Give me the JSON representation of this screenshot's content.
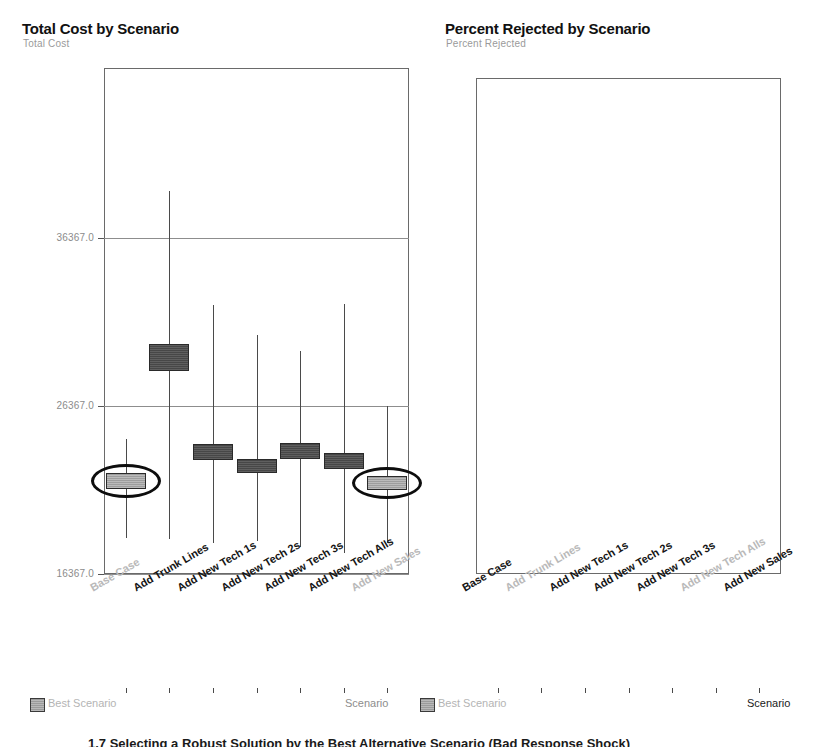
{
  "caption": "1.7 Selecting a Robust Solution by the Best Alternative Scenario (Bad Response Shock)",
  "charts": [
    {
      "id": "total-cost",
      "title": "Total Cost by Scenario",
      "subtitle": "Total Cost",
      "legend_label": "Best Scenario",
      "axis_title": "Scenario",
      "axis_title_active": false,
      "legend_active": false,
      "chart_data": {
        "type": "bar",
        "title": "Total Cost by Scenario",
        "xlabel": "Scenario",
        "ylabel": "Total Cost",
        "ylim": [
          16367.0,
          40896.0
        ],
        "ytick_labels": [
          "36367.0",
          "26367.0",
          "16367.0"
        ],
        "ytick_values": [
          36367.0,
          26367.0,
          16367.0
        ],
        "grid": true,
        "legend_position": "bottom-left",
        "categories": [
          "Base Case",
          "Add Trunk Lines",
          "Add New Tech 1s",
          "Add New Tech 2s",
          "Add New Tech 3s",
          "Add New Tech Alls",
          "Add New Sales"
        ],
        "category_active": [
          false,
          true,
          true,
          true,
          true,
          true,
          false
        ],
        "best_scenario_indices": [
          0,
          6
        ],
        "series": [
          {
            "name": "box-low",
            "values": [
              21450,
              28450,
              23150,
              22400,
              23200,
              22600,
              21350
            ]
          },
          {
            "name": "box-high",
            "values": [
              22400,
              30050,
              24100,
              23200,
              24150,
              23600,
              22200
            ]
          },
          {
            "name": "whisker-low",
            "values": [
              18500,
              18450,
              18200,
              18350,
              17950,
              17600,
              18200
            ]
          },
          {
            "name": "whisker-high",
            "values": [
              24400,
              39200,
              32400,
              30600,
              29650,
              32450,
              26400
            ]
          }
        ]
      }
    },
    {
      "id": "percent-rejected",
      "title": "Percent Rejected by Scenario",
      "subtitle": "Percent Rejected",
      "legend_label": "Best Scenario",
      "axis_title": "Scenario",
      "axis_title_active": true,
      "legend_active": false,
      "chart_data": {
        "type": "bar",
        "title": "Percent Rejected by Scenario",
        "xlabel": "Scenario",
        "ylabel": "Percent Rejected",
        "ylim": [
          1.0,
          24.3
        ],
        "ytick_labels": [
          "21.0",
          "11.0",
          "1.0"
        ],
        "ytick_values": [
          21.0,
          11.0,
          1.0
        ],
        "grid": true,
        "legend_position": "bottom-left",
        "categories": [
          "Base Case",
          "Add Trunk Lines",
          "Add New Tech 1s",
          "Add New Tech 2s",
          "Add New Tech 3s",
          "Add New Tech Alls",
          "Add New Sales"
        ],
        "category_active": [
          true,
          false,
          true,
          true,
          true,
          false,
          true
        ],
        "best_scenario_indices": [
          1,
          5
        ],
        "series": [
          {
            "name": "box-low",
            "values": [
              11.0,
              5.9,
              9.6,
              8.9,
              8.1,
              5.7,
              9.8
            ]
          },
          {
            "name": "box-high",
            "values": [
              12.2,
              7.1,
              10.5,
              9.9,
              9.2,
              7.3,
              10.8
            ]
          },
          {
            "name": "whisker-low",
            "values": [
              3.3,
              1.5,
              1.6,
              1.3,
              1.1,
              1.2,
              1.8
            ]
          },
          {
            "name": "whisker-high",
            "values": [
              23.7,
              13.9,
              19.5,
              20.7,
              17.3,
              23.1,
              15.5
            ]
          }
        ]
      }
    }
  ]
}
